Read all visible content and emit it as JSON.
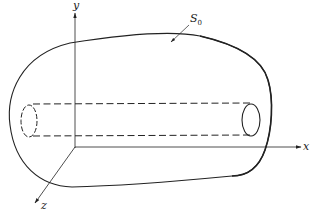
{
  "diagram": {
    "type": "3d-surface-with-tube",
    "axes": {
      "x_label": "x",
      "y_label": "y",
      "z_label": "z"
    },
    "surface": {
      "label": "S",
      "label_subscript": "0"
    },
    "colors": {
      "stroke": "#222222",
      "background": "#ffffff"
    }
  }
}
